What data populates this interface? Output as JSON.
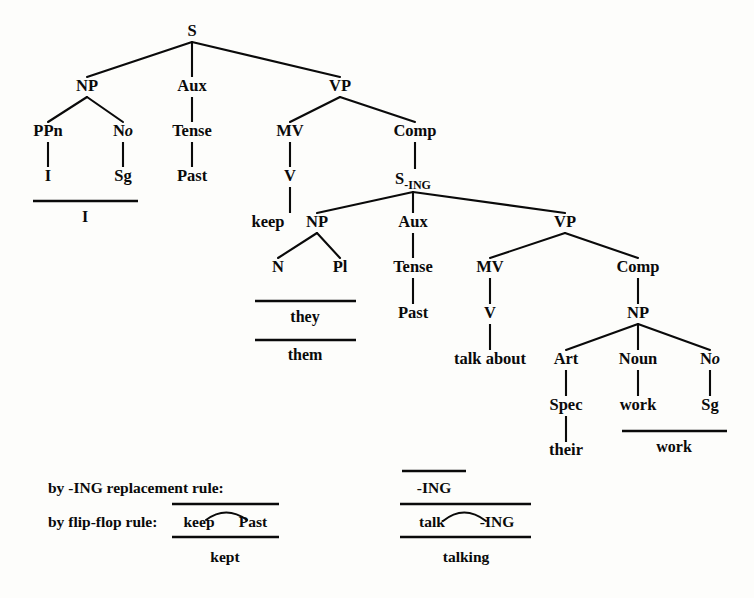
{
  "figure": {
    "type": "syntax-tree-derivation"
  },
  "nodes": {
    "s_root": {
      "label": "S",
      "x": 192,
      "y": 36
    },
    "np_subj": {
      "label": "NP",
      "x": 87,
      "y": 91
    },
    "aux_main": {
      "label": "Aux",
      "x": 192,
      "y": 91
    },
    "vp_main": {
      "label": "VP",
      "x": 340,
      "y": 91
    },
    "ppn": {
      "label": "PPn",
      "x": 48,
      "y": 136
    },
    "no_subj": {
      "label": "N",
      "sub": "o",
      "x": 123,
      "y": 136
    },
    "tense_main": {
      "label": "Tense",
      "x": 192,
      "y": 136
    },
    "mv_main": {
      "label": "MV",
      "x": 290,
      "y": 136
    },
    "comp_main": {
      "label": "Comp",
      "x": 415,
      "y": 136
    },
    "ppn_i": {
      "label": "I",
      "x": 48,
      "y": 181
    },
    "sg_subj": {
      "label": "Sg",
      "x": 123,
      "y": 181
    },
    "past_main": {
      "label": "Past",
      "x": 192,
      "y": 181
    },
    "v_main": {
      "label": "V",
      "x": 290,
      "y": 181
    },
    "s_ing": {
      "label": "S",
      "sub": "-ING",
      "x": 413,
      "y": 184
    },
    "keep": {
      "label": "keep",
      "x": 268,
      "y": 227
    },
    "np_obj": {
      "label": "NP",
      "x": 317,
      "y": 227
    },
    "aux_embed": {
      "label": "Aux",
      "x": 413,
      "y": 227
    },
    "vp_embed": {
      "label": "VP",
      "x": 565,
      "y": 227
    },
    "n_obj": {
      "label": "N",
      "x": 278,
      "y": 272
    },
    "pl_obj": {
      "label": "Pl",
      "x": 340,
      "y": 272
    },
    "tense_embed": {
      "label": "Tense",
      "x": 413,
      "y": 272
    },
    "mv_embed": {
      "label": "MV",
      "x": 490,
      "y": 272
    },
    "comp_embed": {
      "label": "Comp",
      "x": 638,
      "y": 272
    },
    "past_embed": {
      "label": "Past",
      "x": 413,
      "y": 318
    },
    "v_embed": {
      "label": "V",
      "x": 490,
      "y": 318
    },
    "np_embed": {
      "label": "NP",
      "x": 638,
      "y": 318
    },
    "talk_about": {
      "label": "talk about",
      "x": 490,
      "y": 364
    },
    "art": {
      "label": "Art",
      "x": 566,
      "y": 364
    },
    "noun": {
      "label": "Noun",
      "x": 638,
      "y": 364
    },
    "no_obj": {
      "label": "N",
      "sub": "o",
      "x": 710,
      "y": 364
    },
    "spec": {
      "label": "Spec",
      "x": 566,
      "y": 410
    },
    "work_noun": {
      "label": "work",
      "x": 638,
      "y": 410
    },
    "sg_obj": {
      "label": "Sg",
      "x": 710,
      "y": 410
    },
    "their": {
      "label": "their",
      "x": 566,
      "y": 455
    }
  },
  "terminals": {
    "i_result": {
      "label": "I",
      "x": 85,
      "y": 222
    },
    "they_result": {
      "label": "they",
      "x": 305,
      "y": 322
    },
    "them_result": {
      "label": "them",
      "x": 305,
      "y": 360
    },
    "work_result": {
      "label": "work",
      "x": 674,
      "y": 452
    }
  },
  "bars": [
    {
      "name": "bar-i",
      "x1": 33,
      "x2": 138,
      "y": 201
    },
    {
      "name": "bar-they",
      "x1": 255,
      "x2": 356,
      "y": 301
    },
    {
      "name": "bar-them",
      "x1": 255,
      "x2": 356,
      "y": 340
    },
    {
      "name": "bar-work",
      "x1": 622,
      "x2": 727,
      "y": 431
    },
    {
      "name": "bar-ing-top",
      "x1": 402,
      "x2": 466,
      "y": 471
    },
    {
      "name": "bar-talk-ing-top",
      "x1": 400,
      "x2": 531,
      "y": 504
    },
    {
      "name": "bar-keep-past-top",
      "x1": 172,
      "x2": 279,
      "y": 504
    },
    {
      "name": "bar-keep-past-bottom",
      "x1": 172,
      "x2": 279,
      "y": 537
    },
    {
      "name": "bar-talk-ing-bottom",
      "x1": 400,
      "x2": 531,
      "y": 537
    }
  ],
  "rules": {
    "ing_replacement": {
      "caption": "by -ING replacement rule:",
      "caption_x": 48,
      "caption_y": 493,
      "term": "-ING",
      "term_x": 434,
      "term_y": 493
    },
    "flip_flop": {
      "caption": "by flip-flop rule:",
      "caption_x": 48,
      "caption_y": 527,
      "left_term": "keep",
      "left_term_x": 199,
      "right_term": "Past",
      "right_term_x": 253,
      "term_y": 527,
      "embedded_left": "talk",
      "embedded_left_x": 432,
      "embedded_right": "-ING",
      "embedded_right_x": 497,
      "embedded_term_y": 527
    },
    "results": {
      "kept": "kept",
      "kept_x": 225,
      "kept_y": 562,
      "talking": "talking",
      "talking_x": 466,
      "talking_y": 562
    }
  },
  "arcs": [
    {
      "name": "arc-keep-past",
      "cx": 226,
      "cy": 516,
      "rx": 22,
      "ry": 9
    },
    {
      "name": "arc-talk-ing",
      "cx": 464,
      "cy": 516,
      "rx": 24,
      "ry": 10
    }
  ],
  "colors": {
    "ink": "#0a0a0a",
    "paper": "#fdfdfb"
  }
}
